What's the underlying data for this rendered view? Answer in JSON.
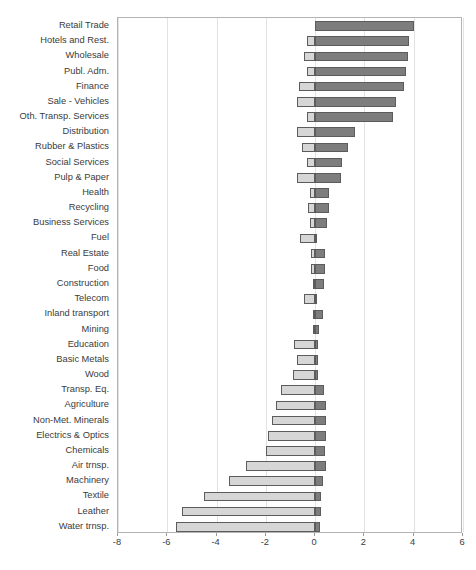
{
  "chart_data": {
    "type": "bar",
    "orientation": "horizontal",
    "stacked": true,
    "title": "",
    "subtitle": "",
    "xlabel": "",
    "ylabel": "",
    "xlim": [
      -8,
      6
    ],
    "xticks": [
      -8,
      -6,
      -4,
      -2,
      0,
      2,
      4,
      6
    ],
    "xtick_labels": [
      "-8",
      "-6",
      "-4",
      "-2",
      "0",
      "2",
      "4",
      "6"
    ],
    "grid": true,
    "grid_axis": "x",
    "legend": null,
    "colors": {
      "negative_segment": "#d6d6d6",
      "positive_segment": "#7d7d7d",
      "bar_outline": "#5c5c5c",
      "gridline": "#e2e2e2",
      "axis": "#b4b4b4",
      "text": "#3b3b3b"
    },
    "categories": [
      "Retail Trade",
      "Hotels and Rest.",
      "Wholesale",
      "Publ. Adm.",
      "Finance",
      "Sale - Vehicles",
      "Oth. Transp. Services",
      "Distribution",
      "Rubber & Plastics",
      "Social Services",
      "Pulp & Paper",
      "Health",
      "Recycling",
      "Business Services",
      "Fuel",
      "Real Estate",
      "Food",
      "Construction",
      "Telecom",
      "Inland transport",
      "Mining",
      "Education",
      "Basic Metals",
      "Wood",
      "Transp. Eq.",
      "Agriculture",
      "Non-Met. Minerals",
      "Electrics & Optics",
      "Chemicals",
      "Air trnsp.",
      "Machinery",
      "Textile",
      "Leather",
      "Water trnsp."
    ],
    "series": [
      {
        "name": "negative",
        "values": [
          0.0,
          -0.35,
          -0.45,
          -0.35,
          -0.65,
          -0.75,
          -0.35,
          -0.75,
          -0.55,
          -0.35,
          -0.75,
          -0.2,
          -0.3,
          -0.2,
          -0.6,
          -0.15,
          -0.15,
          -0.1,
          -0.45,
          -0.1,
          -0.1,
          -0.85,
          -0.75,
          -0.9,
          -1.4,
          -1.6,
          -1.75,
          -1.9,
          -2.0,
          -2.8,
          -3.5,
          -4.5,
          -5.4,
          -5.65
        ]
      },
      {
        "name": "positive",
        "values": [
          4.0,
          3.8,
          3.75,
          3.7,
          3.6,
          3.3,
          3.15,
          1.6,
          1.35,
          1.1,
          1.05,
          0.55,
          0.55,
          0.5,
          0.05,
          0.4,
          0.4,
          0.35,
          0.05,
          0.3,
          0.15,
          0.1,
          0.1,
          0.1,
          0.35,
          0.45,
          0.45,
          0.45,
          0.4,
          0.45,
          0.3,
          0.25,
          0.25,
          0.2
        ]
      }
    ]
  }
}
